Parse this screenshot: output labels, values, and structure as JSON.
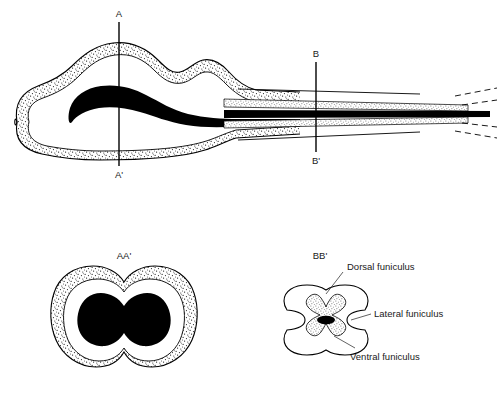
{
  "figure": {
    "title": "",
    "background_color": "#ffffff",
    "ink_color": "#000000"
  },
  "sagittal_view": {
    "name": "sagittal-longitudinal-section",
    "cut_lines": [
      {
        "id": "A",
        "top_label": "A",
        "bottom_label": "A'",
        "x": 119,
        "y_top": 22,
        "y_bottom": 166
      },
      {
        "id": "B",
        "top_label": "B",
        "bottom_label": "B'",
        "x": 316,
        "y_top": 62,
        "y_bottom": 152
      }
    ],
    "tail_note": "dashed continuation at caudal end"
  },
  "cross_sections": [
    {
      "name": "section-aa",
      "title": "AA'",
      "description": "rostral transverse section, bilobed, outer stippled band with central black mass",
      "annotations": []
    },
    {
      "name": "section-bb",
      "title": "BB'",
      "description": "caudal transverse section, butterfly-shaped stippled gray matter with central canal",
      "annotations": [
        {
          "id": "dorsal",
          "label": "Dorsal funiculus"
        },
        {
          "id": "lateral",
          "label": "Lateral funiculus"
        },
        {
          "id": "ventral",
          "label": "Ventral funiculus"
        }
      ]
    }
  ]
}
